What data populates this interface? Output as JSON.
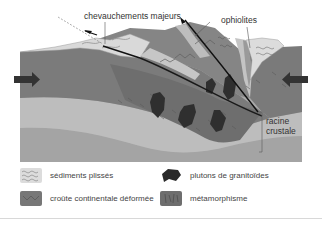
{
  "diagram": {
    "labels": {
      "thrusts": "chevauchements majeurs",
      "ophiolites": "ophiolites",
      "root_line1": "racine",
      "root_line2": "crustale"
    },
    "icons": {
      "left_arrow": "compression-arrow-right",
      "right_arrow": "compression-arrow-left"
    },
    "colors": {
      "upper_crust": "#7a7a7a",
      "middle_band": "#b9b9b9",
      "lower_band": "#a6a6a6",
      "sediments": "#d8d8d8",
      "plutons": "#2e2e2e",
      "thrust_line": "#111111",
      "ophiolite_band": "#c4c4c4"
    }
  },
  "legend": {
    "items": [
      {
        "label": "sédiments plissés",
        "icon": "sediments-swatch"
      },
      {
        "label": "croûte continentale déformée",
        "icon": "deformed-crust-swatch"
      },
      {
        "label": "plutons de granitoïdes",
        "icon": "pluton-swatch"
      },
      {
        "label": "métamorphisme",
        "icon": "metamorphism-swatch"
      }
    ]
  }
}
